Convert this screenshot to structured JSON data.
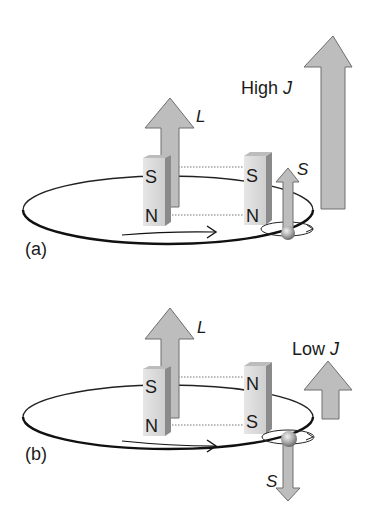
{
  "figure": {
    "colors": {
      "arrow_fill": "#b9b9b9",
      "arrow_stroke": "#6e6e6e",
      "magnet_front": "#dcdcdc",
      "magnet_side": "#8a8a8a",
      "orbit_line": "#111111",
      "text": "#1a1a1a"
    }
  },
  "panel_a": {
    "label": "(a)",
    "orbital_vector_label": "L",
    "spin_vector_label": "S",
    "total_label_prefix": "High ",
    "total_label_symbol": "J",
    "left_magnet": {
      "top_pole": "S",
      "bottom_pole": "N"
    },
    "right_magnet": {
      "top_pole": "S",
      "bottom_pole": "N"
    },
    "spin_direction": "up"
  },
  "panel_b": {
    "label": "(b)",
    "orbital_vector_label": "L",
    "spin_vector_label": "S",
    "total_label_prefix": "Low ",
    "total_label_symbol": "J",
    "left_magnet": {
      "top_pole": "S",
      "bottom_pole": "N"
    },
    "right_magnet": {
      "top_pole": "N",
      "bottom_pole": "S"
    },
    "spin_direction": "down"
  }
}
